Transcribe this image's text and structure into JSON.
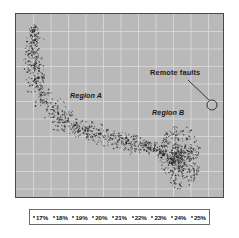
{
  "figure": {
    "background_color": "#ffffff",
    "plot_background_color": "#b9b9b9",
    "grid_color": "#d8d8d8",
    "border_color": "#4a4a4a",
    "point_color": "#262626"
  },
  "annotations": {
    "region_a": "Region A",
    "region_b": "Region B",
    "remote_faults": "Remote faults"
  },
  "legend": {
    "entries": [
      {
        "label": "17%",
        "marker": "dot-marker"
      },
      {
        "label": "18%",
        "marker": "dot-marker"
      },
      {
        "label": "19%",
        "marker": "dot-marker"
      },
      {
        "label": "20%",
        "marker": "dot-marker"
      },
      {
        "label": "21%",
        "marker": "dot-marker"
      },
      {
        "label": "22%",
        "marker": "dot-marker"
      },
      {
        "label": "23%",
        "marker": "dot-marker"
      },
      {
        "label": "24%",
        "marker": "dot-marker"
      },
      {
        "label": "25%",
        "marker": "dot-marker"
      }
    ]
  },
  "chart_data": {
    "type": "scatter",
    "title": "",
    "xlabel": "",
    "ylabel": "",
    "xlim": [
      0,
      209
    ],
    "ylim": [
      0,
      185
    ],
    "grid": true,
    "grid_spacing": 17.5,
    "legend_position": "bottom",
    "legend_entries": [
      "17%",
      "18%",
      "19%",
      "20%",
      "21%",
      "22%",
      "23%",
      "24%",
      "25%"
    ],
    "annotations": [
      {
        "text": "Region A",
        "x": 60,
        "y": 82,
        "style": "italic"
      },
      {
        "text": "Region B",
        "x": 140,
        "y": 99,
        "style": "italic"
      },
      {
        "text": "Remote faults",
        "x": 138,
        "y": 58,
        "style": "normal"
      },
      {
        "type": "circle",
        "name": "remote-faults-marker",
        "cx": 196,
        "cy": 91,
        "r": 5
      },
      {
        "type": "leader-line",
        "x1": 172,
        "y1": 66,
        "x2": 193,
        "y2": 86
      }
    ],
    "clusters": [
      {
        "name": "Region A",
        "description": "L-shaped / hooked arm sweeping from upper-left down then rightwards along the lower portion of the plot",
        "point_count": 560,
        "path_anchors": [
          [
            20,
            12
          ],
          [
            17,
            24
          ],
          [
            15,
            36
          ],
          [
            16,
            48
          ],
          [
            19,
            60
          ],
          [
            23,
            72
          ],
          [
            29,
            84
          ],
          [
            37,
            96
          ],
          [
            47,
            105
          ],
          [
            59,
            112
          ],
          [
            72,
            118
          ],
          [
            86,
            123
          ],
          [
            100,
            127
          ],
          [
            114,
            130
          ],
          [
            128,
            133
          ],
          [
            142,
            137
          ],
          [
            152,
            143
          ],
          [
            158,
            152
          ]
        ],
        "spread": 11
      },
      {
        "name": "Region B",
        "description": "dense isolated circular blob in the lower-right of the plot",
        "point_count": 300,
        "center": [
          164,
          143
        ],
        "radius_x": 21,
        "radius_y": 32
      }
    ],
    "series": [
      {
        "name": "17%",
        "values": []
      },
      {
        "name": "18%",
        "values": []
      },
      {
        "name": "19%",
        "values": []
      },
      {
        "name": "20%",
        "values": []
      },
      {
        "name": "21%",
        "values": []
      },
      {
        "name": "22%",
        "values": []
      },
      {
        "name": "23%",
        "values": []
      },
      {
        "name": "24%",
        "values": []
      },
      {
        "name": "25%",
        "values": []
      }
    ]
  }
}
